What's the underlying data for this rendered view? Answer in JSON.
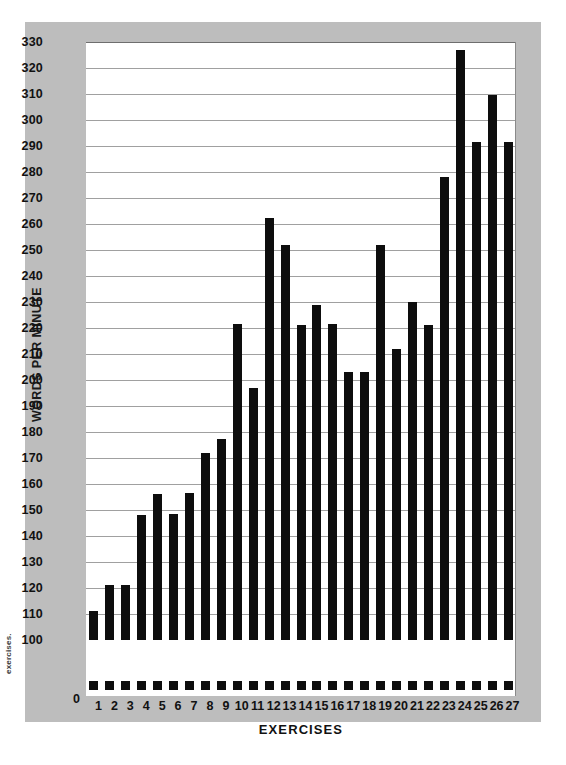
{
  "margin_note": "exercises.",
  "chart_data": {
    "type": "bar",
    "title": "",
    "xlabel": "EXERCISES",
    "ylabel": "WORDS PER MINUTE",
    "ylim": [
      100,
      330
    ],
    "ytick_step": 10,
    "zero_tick_label": "0",
    "axis_break": true,
    "grid": true,
    "legend": "none",
    "bar_color": "#0d0d0d",
    "frame_color": "#bdbdbd",
    "plot_background": "#ffffff",
    "gridline_color": "#a0a0a0",
    "ytick_labels": [
      "330",
      "320",
      "310",
      "300",
      "290",
      "280",
      "270",
      "260",
      "250",
      "240",
      "230",
      "220",
      "210",
      "200",
      "190",
      "180",
      "170",
      "160",
      "150",
      "140",
      "130",
      "120",
      "110",
      "100"
    ],
    "categories": [
      "1",
      "2",
      "3",
      "4",
      "5",
      "6",
      "7",
      "8",
      "9",
      "10",
      "11",
      "12",
      "13",
      "14",
      "15",
      "16",
      "17",
      "18",
      "19",
      "20",
      "21",
      "22",
      "23",
      "24",
      "25",
      "26",
      "27"
    ],
    "values": [
      111,
      121,
      121,
      148,
      156,
      148.5,
      156.5,
      172,
      177.5,
      221.5,
      197,
      262.5,
      252,
      221,
      229,
      221.5,
      203,
      203,
      252,
      212,
      230,
      221,
      278,
      327,
      291.5,
      309.5,
      291.5
    ]
  }
}
